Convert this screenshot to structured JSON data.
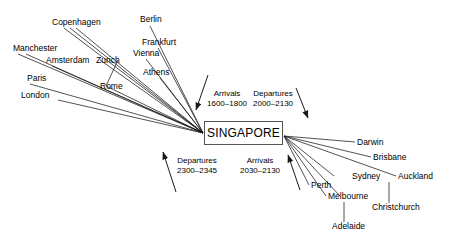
{
  "hub": {
    "label": "SINGAPORE"
  },
  "colors": {
    "line": "#1a1a1a",
    "text": "#000000",
    "box_border": "#555555",
    "background": "#ffffff"
  },
  "annotations": [
    {
      "name": "arrivals-top",
      "title": "Arrivals",
      "time": "1600–1800"
    },
    {
      "name": "departures-top",
      "title": "Departures",
      "time": "2000–2130"
    },
    {
      "name": "departures-bottom",
      "title": "Departures",
      "time": "2300–2345"
    },
    {
      "name": "arrivals-bottom",
      "title": "Arrivals",
      "time": "2030–2130"
    }
  ],
  "europe_cities": [
    {
      "name": "copenhagen",
      "label": "Copenhagen"
    },
    {
      "name": "berlin",
      "label": "Berlin"
    },
    {
      "name": "frankfurt",
      "label": "Frankfurt"
    },
    {
      "name": "vienna",
      "label": "Vienna"
    },
    {
      "name": "athens",
      "label": "Athens"
    },
    {
      "name": "manchester",
      "label": "Manchester"
    },
    {
      "name": "amsterdam",
      "label": "Amsterdam"
    },
    {
      "name": "zurich",
      "label": "Zurich"
    },
    {
      "name": "paris",
      "label": "Paris"
    },
    {
      "name": "rome",
      "label": "Rome"
    },
    {
      "name": "london",
      "label": "London"
    }
  ],
  "australasia_cities": [
    {
      "name": "darwin",
      "label": "Darwin"
    },
    {
      "name": "brisbane",
      "label": "Brisbane"
    },
    {
      "name": "sydney",
      "label": "Sydney"
    },
    {
      "name": "auckland",
      "label": "Auckland"
    },
    {
      "name": "perth",
      "label": "Perth"
    },
    {
      "name": "melbourne",
      "label": "Melbourne"
    },
    {
      "name": "adelaide",
      "label": "Adelaide"
    },
    {
      "name": "christchurch",
      "label": "Christchurch"
    }
  ]
}
